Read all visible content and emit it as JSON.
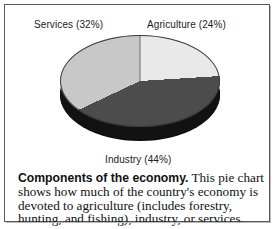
{
  "figure": {
    "labels": {
      "services": "Services  (32%)",
      "agriculture": "Agriculture  (24%)",
      "industry": "Industry  (44%)"
    },
    "caption": {
      "lead": "Components of the economy.",
      "body": " This pie chart shows how much of the country's economy is devoted to agriculture (includes forestry, hunting, and fishing), industry, or services."
    }
  },
  "chart_data": {
    "type": "pie",
    "title": "Components of the economy",
    "categories": [
      "Agriculture",
      "Industry",
      "Services"
    ],
    "values": [
      24,
      44,
      32
    ],
    "value_unit": "percent",
    "labels": [
      "Agriculture  (24%)",
      "Industry  (44%)",
      "Services  (32%)"
    ],
    "colors": [
      "#e9e9e9",
      "#4c4c4c",
      "#c8c8c8"
    ],
    "side_color": "#121212",
    "start_angle_deg": 0,
    "direction": "clockwise",
    "three_d": true,
    "legend": "none",
    "grid": false,
    "label_placement": "outside"
  }
}
